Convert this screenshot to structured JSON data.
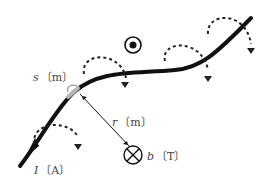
{
  "diagram": {
    "labels": {
      "current_symbol": "I",
      "current_unit": "〔A〕",
      "segment_symbol": "s",
      "segment_unit": "〔m〕",
      "distance_symbol": "r",
      "distance_unit": "〔m〕",
      "field_symbol": "b",
      "field_unit": "〔T〕"
    },
    "symbols": {
      "out_of_page": "dot-in-circle",
      "into_page": "cross-in-circle"
    },
    "colors": {
      "wire": "#111111",
      "segment": "#b0b0b0",
      "field_lines": "#222222"
    }
  }
}
